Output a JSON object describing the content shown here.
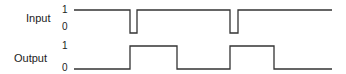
{
  "diagram": {
    "type": "timing-diagram",
    "signals": [
      {
        "name": "Input",
        "high_label": "1",
        "low_label": "0",
        "y_high": 10,
        "y_low": 33,
        "x_start": 74,
        "x_end": 332,
        "initial": "high",
        "transitions": [
          130,
          137,
          230,
          238
        ]
      },
      {
        "name": "Output",
        "high_label": "1",
        "low_label": "0",
        "y_high": 46,
        "y_low": 69,
        "x_start": 74,
        "x_end": 332,
        "initial": "low",
        "transitions": [
          130,
          177,
          230,
          274
        ]
      }
    ]
  },
  "labels": {
    "input": "Input",
    "output": "Output",
    "input_one": "1",
    "input_zero": "0",
    "output_one": "1",
    "output_zero": "0"
  },
  "colors": {
    "line": "#333333",
    "text": "#222222"
  }
}
